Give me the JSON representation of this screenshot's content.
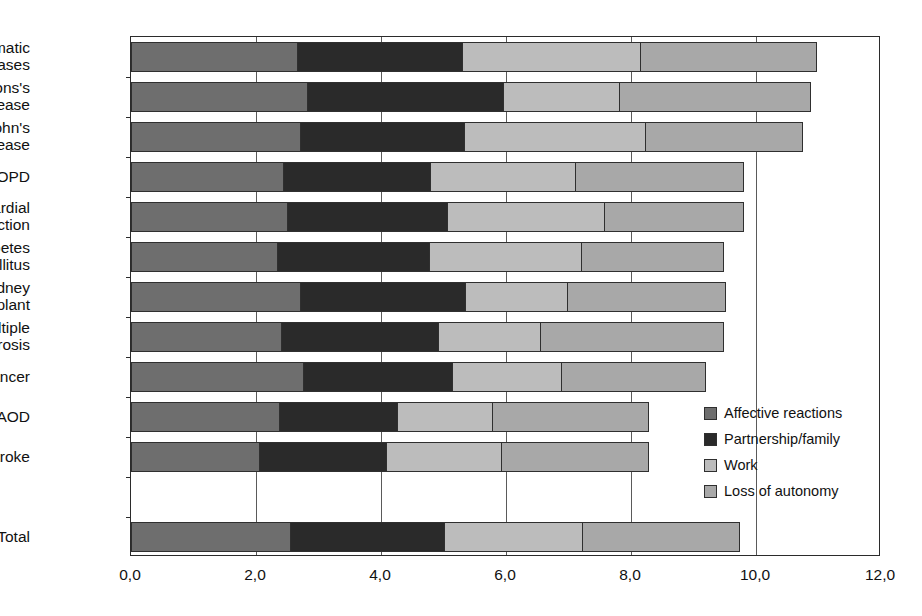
{
  "chart_data": {
    "type": "bar",
    "orientation": "horizontal",
    "stacked": true,
    "title": "",
    "subtitle": "",
    "xlabel": "",
    "ylabel": "",
    "xlim": [
      0.0,
      12.0
    ],
    "xticks": [
      0.0,
      2.0,
      4.0,
      6.0,
      8.0,
      10.0,
      12.0
    ],
    "xtick_labels": [
      "0,0",
      "2,0",
      "4,0",
      "6,0",
      "8,0",
      "10,0",
      "12,0"
    ],
    "grid": "vertical",
    "legend_position": "inside-bottom-right",
    "decimal_separator": ",",
    "categories": [
      "Rheumatic\ndiseases",
      "Parkinsons's\ndisease",
      "Crohn's\ndisease",
      "COPD",
      "Myocardial\ninfarction",
      "Diabetes\nmellitus",
      "Kidney\ntransplant",
      "Multiple\nsclerosis",
      "Cancer",
      "PAOD",
      "Stroke",
      "",
      "Total"
    ],
    "series": [
      {
        "name": "Affective reactions",
        "color": "#6e6e6e",
        "values": [
          2.67,
          2.83,
          2.72,
          2.45,
          2.51,
          2.35,
          2.72,
          2.41,
          2.76,
          2.39,
          2.07,
          null,
          2.56
        ]
      },
      {
        "name": "Partnership/family",
        "color": "#2a2a2a",
        "values": [
          2.66,
          3.15,
          2.64,
          2.37,
          2.58,
          2.45,
          2.65,
          2.54,
          2.41,
          1.89,
          2.04,
          null,
          2.48
        ]
      },
      {
        "name": "Work",
        "color": "#bcbcbc",
        "values": [
          2.86,
          1.88,
          2.91,
          2.33,
          2.53,
          2.45,
          1.66,
          1.64,
          1.76,
          1.55,
          1.85,
          null,
          2.22
        ]
      },
      {
        "name": "Loss of autonomy",
        "color": "#a8a8a8",
        "values": [
          2.83,
          3.07,
          2.53,
          2.71,
          2.24,
          2.29,
          2.54,
          2.95,
          2.32,
          2.5,
          2.37,
          null,
          2.53
        ]
      }
    ],
    "totals": [
      11.02,
      10.93,
      10.8,
      9.86,
      9.86,
      9.54,
      9.57,
      9.54,
      9.25,
      8.33,
      8.33,
      null,
      9.79
    ]
  },
  "legend": {
    "items": [
      {
        "label": "Affective reactions",
        "color": "#6e6e6e"
      },
      {
        "label": "Partnership/family",
        "color": "#2a2a2a"
      },
      {
        "label": "Work",
        "color": "#bcbcbc"
      },
      {
        "label": "Loss of autonomy",
        "color": "#a8a8a8"
      }
    ]
  },
  "axis": {
    "x_tick_labels": [
      "0,0",
      "2,0",
      "4,0",
      "6,0",
      "8,0",
      "10,0",
      "12,0"
    ]
  }
}
